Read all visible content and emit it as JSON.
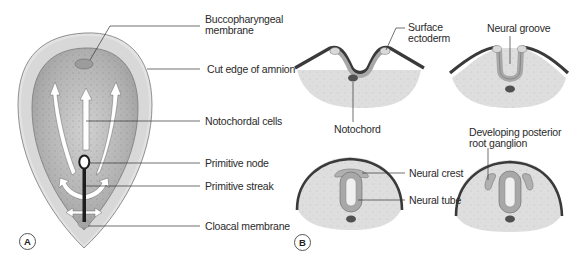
{
  "figure": {
    "panels": [
      {
        "id": "A",
        "badge": "A",
        "labels": {
          "buccopharyngeal_line1": "Buccopharyngeal",
          "buccopharyngeal_line2": "membrane",
          "cut_edge": "Cut edge of amnion",
          "notochordal_cells": "Notochordal cells",
          "primitive_node": "Primitive node",
          "primitive_streak": "Primitive streak",
          "cloacal_membrane": "Cloacal membrane"
        }
      },
      {
        "id": "B",
        "badge": "B",
        "labels": {
          "surface_ectoderm_line1": "Surface",
          "surface_ectoderm_line2": "ectoderm",
          "notochord": "Notochord",
          "neural_groove": "Neural groove",
          "neural_crest": "Neural crest",
          "neural_tube": "Neural tube",
          "posterior_root_line1": "Developing posterior",
          "posterior_root_line2": "root ganglion"
        }
      }
    ],
    "colors": {
      "amnion_fill": "#d8d8d8",
      "embryo_fill": "#b4b4b4",
      "mesoderm_fill": "#dcdcdc",
      "ectoderm": "#3a3a3a",
      "neural_plate": "#a8a8a8",
      "notochord": "#505050",
      "leader_line": "#333333"
    }
  }
}
